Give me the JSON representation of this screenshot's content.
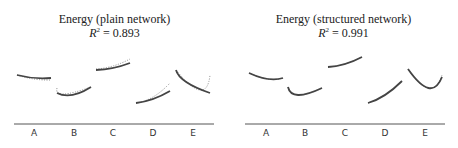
{
  "chart_data": [
    {
      "type": "line",
      "title": "Energy (plain network)",
      "subtitle": "R^2 = 0.893",
      "r2": "0.893",
      "categories": [
        "A",
        "B",
        "C",
        "D",
        "E"
      ],
      "xlabel": "",
      "ylabel": "",
      "grid": false,
      "legend": "none",
      "series": [
        {
          "name": "predicted (solid)",
          "style": "solid",
          "segments": {
            "A": [
              [
                0,
                0.4
              ],
              [
                0.5,
                0.37
              ],
              [
                1,
                0.37
              ]
            ],
            "B": [
              [
                0,
                0.22
              ],
              [
                0.45,
                0.2
              ],
              [
                1,
                0.28
              ]
            ],
            "C": [
              [
                0,
                0.45
              ],
              [
                0.5,
                0.47
              ],
              [
                1,
                0.52
              ]
            ],
            "D": [
              [
                0,
                0.12
              ],
              [
                0.5,
                0.16
              ],
              [
                1,
                0.24
              ]
            ],
            "E": [
              [
                0,
                0.45
              ],
              [
                0.3,
                0.33
              ],
              [
                1,
                0.22
              ]
            ]
          }
        },
        {
          "name": "actual (dotted)",
          "style": "dotted",
          "segments": {
            "A": [
              [
                0,
                0.4
              ],
              [
                0.5,
                0.36
              ],
              [
                1,
                0.35
              ]
            ],
            "B": [
              [
                0,
                0.27
              ],
              [
                0.2,
                0.21
              ],
              [
                1,
                0.28
              ]
            ],
            "C": [
              [
                0,
                0.46
              ],
              [
                0.5,
                0.49
              ],
              [
                1,
                0.56
              ]
            ],
            "D": [
              [
                0,
                0.12
              ],
              [
                0.5,
                0.18
              ],
              [
                1,
                0.32
              ]
            ],
            "E": [
              [
                0,
                0.45
              ],
              [
                0.7,
                0.25
              ],
              [
                1,
                0.4
              ]
            ]
          }
        }
      ]
    },
    {
      "type": "line",
      "title": "Energy (structured network)",
      "subtitle": "R^2 = 0.991",
      "r2": "0.991",
      "categories": [
        "A",
        "B",
        "C",
        "D",
        "E"
      ],
      "xlabel": "",
      "ylabel": "",
      "grid": false,
      "legend": "none",
      "series": [
        {
          "name": "predicted (solid)",
          "style": "solid",
          "segments": {
            "A": [
              [
                0,
                0.42
              ],
              [
                0.55,
                0.36
              ],
              [
                1,
                0.37
              ]
            ],
            "B": [
              [
                0,
                0.28
              ],
              [
                0.3,
                0.2
              ],
              [
                1,
                0.27
              ]
            ],
            "C": [
              [
                0,
                0.48
              ],
              [
                0.5,
                0.51
              ],
              [
                1,
                0.58
              ]
            ],
            "D": [
              [
                0,
                0.12
              ],
              [
                0.5,
                0.2
              ],
              [
                1,
                0.34
              ]
            ],
            "E": [
              [
                0,
                0.46
              ],
              [
                0.6,
                0.27
              ],
              [
                1,
                0.38
              ]
            ]
          }
        },
        {
          "name": "actual (dotted)",
          "style": "dotted",
          "segments": {
            "A": [
              [
                0,
                0.42
              ],
              [
                0.55,
                0.36
              ],
              [
                1,
                0.37
              ]
            ],
            "B": [
              [
                0,
                0.28
              ],
              [
                0.3,
                0.2
              ],
              [
                1,
                0.27
              ]
            ],
            "C": [
              [
                0,
                0.48
              ],
              [
                0.5,
                0.51
              ],
              [
                1,
                0.58
              ]
            ],
            "D": [
              [
                0,
                0.12
              ],
              [
                0.5,
                0.2
              ],
              [
                1,
                0.34
              ]
            ],
            "E": [
              [
                0,
                0.46
              ],
              [
                0.6,
                0.27
              ],
              [
                1,
                0.4
              ]
            ]
          }
        }
      ]
    }
  ],
  "panels": [
    {
      "title": "Energy (plain network)",
      "r2_label": "R",
      "r2_sup": "2",
      "r2_eq": " = ",
      "r2_value": "0.893",
      "categories": [
        "A",
        "B",
        "C",
        "D",
        "E"
      ]
    },
    {
      "title": "Energy (structured network)",
      "r2_label": "R",
      "r2_sup": "2",
      "r2_eq": " = ",
      "r2_value": "0.991",
      "categories": [
        "A",
        "B",
        "C",
        "D",
        "E"
      ]
    }
  ],
  "colors": {
    "solid": "#444444",
    "dotted": "#888888",
    "axis": "#555555",
    "text": "#222222"
  }
}
